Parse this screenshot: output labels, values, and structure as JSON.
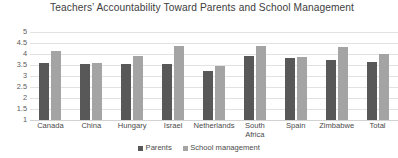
{
  "chart_data": {
    "type": "bar",
    "title": "Teachers’ Accountability Toward Parents and  School Management",
    "title_line1": "Teachers’ Accountability Toward Parents and  School",
    "title_line2": "Management",
    "xlabel": "",
    "ylabel": "",
    "ylim": [
      1,
      5
    ],
    "ytick_labels": [
      "5",
      "4.5",
      "4",
      "3.5",
      "3",
      "2.5",
      "2",
      "1.5",
      "1"
    ],
    "yticks": [
      5,
      4.5,
      4,
      3.5,
      3,
      2.5,
      2,
      1.5,
      1
    ],
    "grid": true,
    "legend_position": "bottom",
    "categories": [
      "Canada",
      "China",
      "Hungary",
      "Israel",
      "Netherlands",
      "South\nAfrica",
      "Spain",
      "Zimbabwe",
      "Total"
    ],
    "series": [
      {
        "name": "Parents",
        "color": "#585858",
        "values": [
          3.6,
          3.55,
          3.55,
          3.55,
          3.25,
          3.9,
          3.8,
          3.75,
          3.65
        ]
      },
      {
        "name": "School management",
        "color": "#a4a4a4",
        "values": [
          4.15,
          3.6,
          3.9,
          4.35,
          3.45,
          4.35,
          3.85,
          4.3,
          4.0
        ]
      }
    ]
  },
  "legend": {
    "items": [
      {
        "label": "Parents",
        "color": "#585858"
      },
      {
        "label": "School management",
        "color": "#a4a4a4"
      }
    ]
  }
}
